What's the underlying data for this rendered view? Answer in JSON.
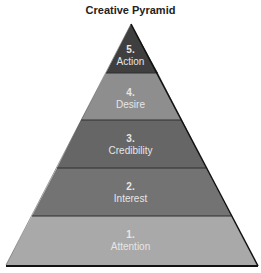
{
  "title": "Creative Pyramid",
  "tiers": [
    {
      "number": "5.",
      "label": "Action",
      "color": "#3f3f3f"
    },
    {
      "number": "4.",
      "label": "Desire",
      "color": "#8e8e8e"
    },
    {
      "number": "3.",
      "label": "Credibility",
      "color": "#666666"
    },
    {
      "number": "2.",
      "label": "Interest",
      "color": "#737373"
    },
    {
      "number": "1.",
      "label": "Attention",
      "color": "#a9a9a9"
    }
  ]
}
